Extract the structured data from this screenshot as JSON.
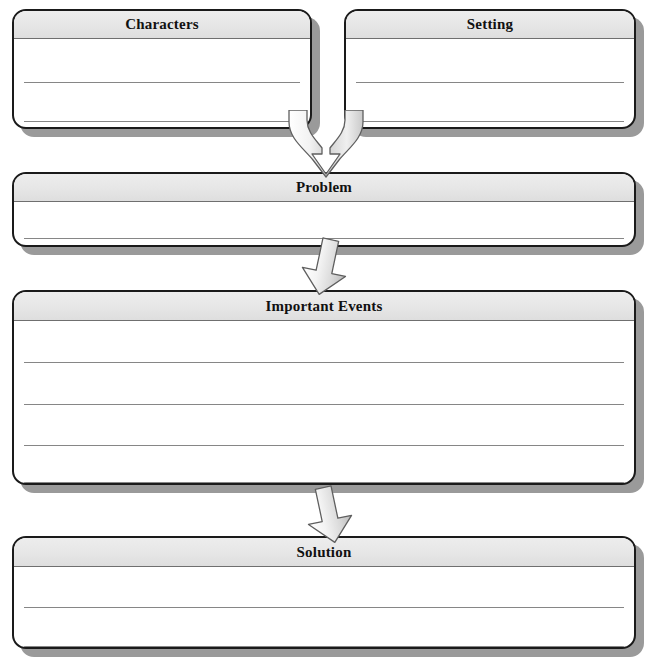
{
  "document": {
    "type": "graphic-organizer",
    "name": "Story Map",
    "orientation": "vertical-flow"
  },
  "palette": {
    "page_background": "#ffffff",
    "box_fill": "#ffffff",
    "box_border": "#1a1a1a",
    "header_fill": "#e6e6e6",
    "header_divider": "#6f6f6f",
    "rule_line": "#868686",
    "shadow": "#9a9a9a",
    "arrow_fill_light": "#fbfbfb",
    "arrow_fill_mid": "#d6d6d6",
    "arrow_outline": "#5f5f5f",
    "title_text": "#111111"
  },
  "boxes": [
    {
      "id": "characters",
      "title": "Characters",
      "writing_lines": 2,
      "x": 12,
      "y": 9,
      "w": 300,
      "h": 120,
      "header_h": 28
    },
    {
      "id": "setting",
      "title": "Setting",
      "writing_lines": 2,
      "x": 344,
      "y": 9,
      "w": 292,
      "h": 120,
      "header_h": 28
    },
    {
      "id": "problem",
      "title": "Problem",
      "writing_lines": 1,
      "x": 12,
      "y": 172,
      "w": 624,
      "h": 75,
      "header_h": 28
    },
    {
      "id": "important-events",
      "title": "Important Events",
      "writing_lines": 4,
      "x": 12,
      "y": 290,
      "w": 624,
      "h": 195,
      "header_h": 29
    },
    {
      "id": "solution",
      "title": "Solution",
      "writing_lines": 2,
      "x": 12,
      "y": 536,
      "w": 624,
      "h": 113,
      "header_h": 29
    }
  ],
  "arrows": [
    {
      "id": "merge-to-problem",
      "kind": "merging-double-stem",
      "from": [
        "characters",
        "setting"
      ],
      "to": "problem",
      "direction": "down",
      "x": 285,
      "y": 110,
      "w": 82,
      "h": 68
    },
    {
      "id": "problem-to-events",
      "kind": "single-block",
      "from": "problem",
      "to": "important-events",
      "direction": "down",
      "tilt_deg": 12,
      "x": 296,
      "y": 238,
      "w": 58,
      "h": 58
    },
    {
      "id": "events-to-solution",
      "kind": "single-block",
      "from": "important-events",
      "to": "solution",
      "direction": "down",
      "tilt_deg": -12,
      "x": 300,
      "y": 486,
      "w": 58,
      "h": 58
    }
  ]
}
